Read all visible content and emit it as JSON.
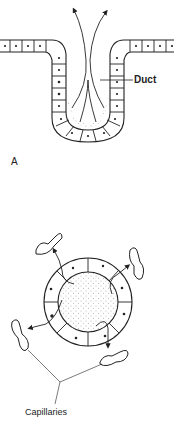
{
  "figure": {
    "panel_a": {
      "label": "A",
      "callouts": [
        {
          "text": "Duct"
        }
      ]
    },
    "panel_b": {
      "callouts": [
        {
          "text": "Capillaries"
        }
      ]
    }
  },
  "colors": {
    "ink": "#222222",
    "background": "#ffffff",
    "stipple": "#777777"
  }
}
